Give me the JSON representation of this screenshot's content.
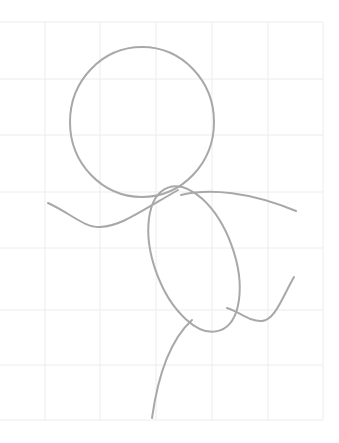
{
  "drawing": {
    "subject": "stick-figure-sketch",
    "background": "#ffffff",
    "stroke_color": "#a8a8a8",
    "grid_color": "#ececec",
    "grid": {
      "x_lines": [
        0,
        45,
        100,
        156,
        212,
        268,
        323
      ],
      "y_lines": [
        22,
        79,
        135,
        192,
        248,
        310,
        365,
        420
      ]
    },
    "parts": [
      {
        "name": "head",
        "shape": "ellipse",
        "cx": 142,
        "cy": 122,
        "rx": 72,
        "ry": 75
      },
      {
        "name": "body",
        "shape": "ellipse",
        "cx": 194,
        "cy": 259,
        "rx": 40,
        "ry": 76,
        "rotate": -20
      },
      {
        "name": "left-arm",
        "shape": "path"
      },
      {
        "name": "right-arm",
        "shape": "path"
      },
      {
        "name": "left-leg",
        "shape": "path"
      },
      {
        "name": "right-leg",
        "shape": "path"
      }
    ]
  }
}
